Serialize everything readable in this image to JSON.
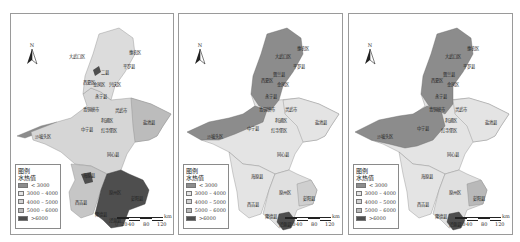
{
  "figure": {
    "panel_count": 3
  },
  "common": {
    "north_label": "N",
    "legend_title_1": "图例",
    "legend_title_2": "水热值",
    "legend_classes": [
      {
        "label": "< 3000",
        "color": "#8c8c8c"
      },
      {
        "label": "3000 – 4000",
        "color": "#e4e4e4"
      },
      {
        "label": "4000 – 5000",
        "color": "#d2d2d2"
      },
      {
        "label": "5000 – 6000",
        "color": "#b9b9b9"
      },
      {
        "label": ">6000",
        "color": "#4e4e4e"
      }
    ],
    "scale_ticks": [
      "0",
      "20",
      "40",
      "80",
      "120"
    ],
    "scale_unit": "km"
  },
  "panels": [
    {
      "id": "panel-1",
      "region_labels": [
        {
          "text": "惠农区",
          "x": 118,
          "y": 40
        },
        {
          "text": "大武口区",
          "x": 70,
          "y": 44
        },
        {
          "text": "平罗县",
          "x": 114,
          "y": 54
        },
        {
          "text": "兴庆区",
          "x": 92,
          "y": 66
        },
        {
          "text": "西夏区",
          "x": 78,
          "y": 72
        },
        {
          "text": "金凤区",
          "x": 88,
          "y": 73
        },
        {
          "text": "灵武市",
          "x": 104,
          "y": 72
        },
        {
          "text": "永宁县",
          "x": 84,
          "y": 84
        },
        {
          "text": "青铜峡市",
          "x": 72,
          "y": 97
        },
        {
          "text": "吴忠市",
          "x": 108,
          "y": 98
        },
        {
          "text": "利通区",
          "x": 92,
          "y": 108
        },
        {
          "text": "盐池县",
          "x": 140,
          "y": 110
        },
        {
          "text": "中宁县",
          "x": 72,
          "y": 117
        },
        {
          "text": "红寺堡区",
          "x": 96,
          "y": 118
        },
        {
          "text": "沙坡头区",
          "x": 44,
          "y": 124
        },
        {
          "text": "同心县",
          "x": 100,
          "y": 142
        },
        {
          "text": "海原县",
          "x": 76,
          "y": 166
        },
        {
          "text": "原州区",
          "x": 102,
          "y": 178
        },
        {
          "text": "彭阳县",
          "x": 124,
          "y": 186
        },
        {
          "text": "西吉县",
          "x": 72,
          "y": 190
        },
        {
          "text": "隆德县",
          "x": 88,
          "y": 205
        },
        {
          "text": "泾源县",
          "x": 102,
          "y": 209
        }
      ],
      "fills": {
        "north": "#dcdcdc",
        "middle_east": "#cfcfcf",
        "middle_west": "#d8d8d8",
        "south_west": "#c6c6c6",
        "south_core": "#4e4e4e",
        "west_strip": "#8c8c8c",
        "yanchi": "#bcbcbc"
      }
    },
    {
      "id": "panel-2",
      "region_labels": [
        {
          "text": "惠农区",
          "x": 118,
          "y": 40
        },
        {
          "text": "大武口区",
          "x": 104,
          "y": 44
        },
        {
          "text": "平罗县",
          "x": 114,
          "y": 54
        },
        {
          "text": "贺兰县",
          "x": 94,
          "y": 62
        },
        {
          "text": "西夏区",
          "x": 84,
          "y": 68
        },
        {
          "text": "金凤区",
          "x": 98,
          "y": 72
        },
        {
          "text": "兴庆区",
          "x": 110,
          "y": 72
        },
        {
          "text": "永宁县",
          "x": 90,
          "y": 84
        },
        {
          "text": "青铜峡市",
          "x": 82,
          "y": 97
        },
        {
          "text": "灵武市",
          "x": 108,
          "y": 97
        },
        {
          "text": "利通区",
          "x": 104,
          "y": 108
        },
        {
          "text": "盐池县",
          "x": 140,
          "y": 110
        },
        {
          "text": "中宁县",
          "x": 72,
          "y": 117
        },
        {
          "text": "红寺堡区",
          "x": 100,
          "y": 118
        },
        {
          "text": "沙坡头区",
          "x": 40,
          "y": 124
        },
        {
          "text": "同心县",
          "x": 100,
          "y": 142
        },
        {
          "text": "海原县",
          "x": 76,
          "y": 166
        },
        {
          "text": "原州区",
          "x": 104,
          "y": 180
        },
        {
          "text": "彭阳县",
          "x": 126,
          "y": 186
        },
        {
          "text": "西吉县",
          "x": 72,
          "y": 192
        },
        {
          "text": "隆德县",
          "x": 92,
          "y": 205
        },
        {
          "text": "泾源县",
          "x": 104,
          "y": 210
        }
      ],
      "fills": {
        "north": "#8c8c8c",
        "middle_east": "#e4e4e4",
        "middle_west": "#8c8c8c",
        "south_west": "#e4e4e4",
        "south_core": "#e0e0e0",
        "jingyuan": "#4e4e4e",
        "yanchi": "#e4e4e4",
        "pengyang": "#cfcfcf"
      }
    },
    {
      "id": "panel-3",
      "region_labels": [
        {
          "text": "惠农区",
          "x": 118,
          "y": 40
        },
        {
          "text": "大武口区",
          "x": 104,
          "y": 44
        },
        {
          "text": "平罗县",
          "x": 114,
          "y": 54
        },
        {
          "text": "贺兰县",
          "x": 94,
          "y": 62
        },
        {
          "text": "西夏区",
          "x": 84,
          "y": 68
        },
        {
          "text": "金凤区",
          "x": 98,
          "y": 72
        },
        {
          "text": "兴庆区",
          "x": 110,
          "y": 72
        },
        {
          "text": "永宁县",
          "x": 90,
          "y": 84
        },
        {
          "text": "青铜峡市",
          "x": 82,
          "y": 97
        },
        {
          "text": "灵武市",
          "x": 108,
          "y": 97
        },
        {
          "text": "利通区",
          "x": 104,
          "y": 108
        },
        {
          "text": "盐池县",
          "x": 140,
          "y": 110
        },
        {
          "text": "中宁县",
          "x": 72,
          "y": 117
        },
        {
          "text": "红寺堡区",
          "x": 100,
          "y": 118
        },
        {
          "text": "沙坡头区",
          "x": 40,
          "y": 124
        },
        {
          "text": "同心县",
          "x": 100,
          "y": 142
        },
        {
          "text": "海原县",
          "x": 76,
          "y": 166
        },
        {
          "text": "原州区",
          "x": 104,
          "y": 180
        },
        {
          "text": "彭阳县",
          "x": 126,
          "y": 186
        },
        {
          "text": "西吉县",
          "x": 72,
          "y": 192
        },
        {
          "text": "隆德县",
          "x": 92,
          "y": 205
        },
        {
          "text": "泾源县",
          "x": 104,
          "y": 210
        }
      ],
      "fills": {
        "north": "#8c8c8c",
        "middle_east": "#e4e4e4",
        "middle_west": "#8c8c8c",
        "south_west": "#e4e4e4",
        "south_core": "#e0e0e0",
        "jingyuan": "#4e4e4e",
        "yanchi": "#e4e4e4",
        "pengyang": "#b9b9b9"
      }
    }
  ]
}
